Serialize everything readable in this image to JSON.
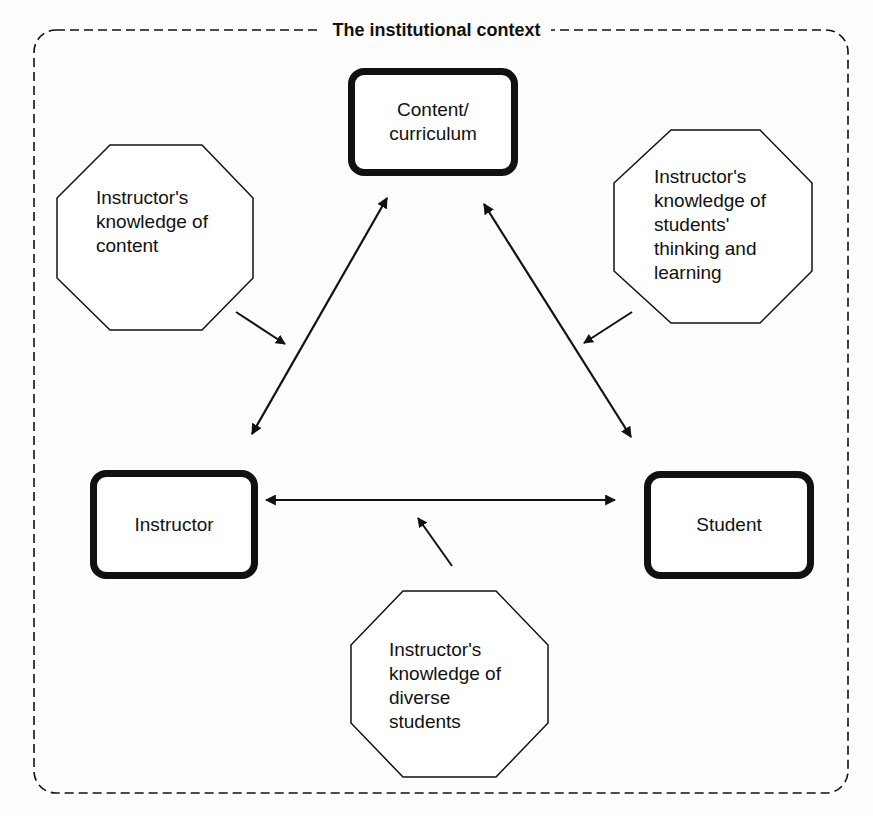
{
  "diagram": {
    "title": "The institutional context",
    "nodes": {
      "content": {
        "label": "Content/\ncurriculum",
        "shape": "rounded-rect"
      },
      "instructor": {
        "label": "Instructor",
        "shape": "rounded-rect"
      },
      "student": {
        "label": "Student",
        "shape": "rounded-rect"
      }
    },
    "knowledge": {
      "content_knowledge": {
        "label": "Instructor's\nknowledge of\ncontent",
        "shape": "octagon"
      },
      "student_thinking": {
        "label": "Instructor's\nknowledge of\nstudents'\nthinking and\nlearning",
        "shape": "octagon"
      },
      "diverse_students": {
        "label": "Instructor's\nknowledge of\ndiverse\nstudents",
        "shape": "octagon"
      }
    },
    "edges": [
      {
        "from": "instructor",
        "to": "content",
        "type": "bidirectional"
      },
      {
        "from": "content",
        "to": "student",
        "type": "bidirectional"
      },
      {
        "from": "instructor",
        "to": "student",
        "type": "bidirectional"
      },
      {
        "from": "content_knowledge",
        "to": "instructor-content edge",
        "type": "directed"
      },
      {
        "from": "student_thinking",
        "to": "content-student edge",
        "type": "directed"
      },
      {
        "from": "diverse_students",
        "to": "instructor-student edge",
        "type": "directed"
      }
    ],
    "colors": {
      "stroke": "#111111",
      "background": "#fdfdfd"
    }
  }
}
